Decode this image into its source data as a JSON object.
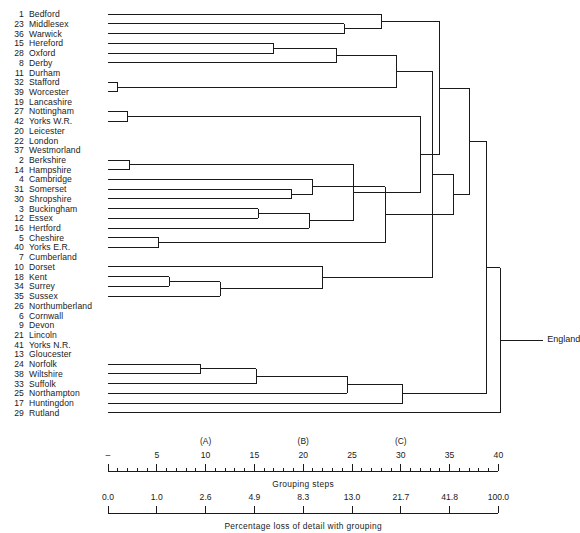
{
  "figure": {
    "type": "dendrogram",
    "root_label": "England",
    "group_markers": [
      {
        "label": "(A)",
        "step": 10
      },
      {
        "label": "(B)",
        "step": 20
      },
      {
        "label": "(C)",
        "step": 30
      }
    ],
    "axes": [
      {
        "name": "grouping-steps-axis",
        "caption": "Grouping  steps",
        "ticks": [
          "–",
          "5",
          "10",
          "15",
          "20",
          "25",
          "30",
          "35",
          "40"
        ],
        "tick_steps": [
          0,
          5,
          10,
          15,
          20,
          25,
          30,
          35,
          40
        ],
        "minor_interval": 1,
        "range": [
          0,
          41
        ]
      },
      {
        "name": "percentage-loss-axis",
        "caption": "Percentage  loss  of  detail  with  grouping",
        "ticks": [
          "0.0",
          "1.0",
          "2.6",
          "4.9",
          "8.3",
          "13.0",
          "21.7",
          "41.8",
          "100.0"
        ],
        "tick_steps": [
          0,
          5,
          10,
          15,
          20,
          25,
          30,
          35,
          40
        ],
        "range": [
          0,
          41
        ]
      }
    ],
    "leaves": [
      {
        "num": "1",
        "name": "Bedford"
      },
      {
        "num": "23",
        "name": "Middlesex"
      },
      {
        "num": "36",
        "name": "Warwick"
      },
      {
        "num": "15",
        "name": "Hereford"
      },
      {
        "num": "28",
        "name": "Oxford"
      },
      {
        "num": "8",
        "name": "Derby"
      },
      {
        "num": "11",
        "name": "Durham"
      },
      {
        "num": "32",
        "name": "Stafford"
      },
      {
        "num": "39",
        "name": "Worcester"
      },
      {
        "num": "19",
        "name": "Lancashire"
      },
      {
        "num": "27",
        "name": "Nottingham"
      },
      {
        "num": "42",
        "name": "Yorks  W.R."
      },
      {
        "num": "20",
        "name": "Leicester"
      },
      {
        "num": "22",
        "name": "London"
      },
      {
        "num": "37",
        "name": "Westmorland"
      },
      {
        "num": "2",
        "name": "Berkshire"
      },
      {
        "num": "14",
        "name": "Hampshire"
      },
      {
        "num": "4",
        "name": "Cambridge"
      },
      {
        "num": "31",
        "name": "Somerset"
      },
      {
        "num": "30",
        "name": "Shropshire"
      },
      {
        "num": "3",
        "name": "Buckingham"
      },
      {
        "num": "12",
        "name": "Essex"
      },
      {
        "num": "16",
        "name": "Hertford"
      },
      {
        "num": "5",
        "name": "Cheshire"
      },
      {
        "num": "40",
        "name": "Yorks  E.R."
      },
      {
        "num": "7",
        "name": "Cumberland"
      },
      {
        "num": "10",
        "name": "Dorset"
      },
      {
        "num": "18",
        "name": "Kent"
      },
      {
        "num": "34",
        "name": "Surrey"
      },
      {
        "num": "35",
        "name": "Sussex"
      },
      {
        "num": "26",
        "name": "Northumberland"
      },
      {
        "num": "6",
        "name": "Cornwall"
      },
      {
        "num": "9",
        "name": "Devon"
      },
      {
        "num": "21",
        "name": "Lincoln"
      },
      {
        "num": "41",
        "name": "Yorks  N.R."
      },
      {
        "num": "13",
        "name": "Gloucester"
      },
      {
        "num": "24",
        "name": "Norfolk"
      },
      {
        "num": "38",
        "name": "Wiltshire"
      },
      {
        "num": "33",
        "name": "Suffolk"
      },
      {
        "num": "25",
        "name": "Northampton"
      },
      {
        "num": "17",
        "name": "Huntingdon"
      },
      {
        "num": "29",
        "name": "Rutland"
      }
    ],
    "merges": [
      {
        "id": "m1",
        "children": [
          "leaf:7",
          "leaf:8"
        ],
        "step": 1.0
      },
      {
        "id": "m2",
        "children": [
          "leaf:10",
          "leaf:11"
        ],
        "step": 2.0
      },
      {
        "id": "m3",
        "children": [
          "leaf:15",
          "leaf:16"
        ],
        "step": 2.2
      },
      {
        "id": "m4",
        "children": [
          "leaf:23",
          "leaf:24"
        ],
        "step": 5.2
      },
      {
        "id": "m5",
        "children": [
          "leaf:27",
          "leaf:28"
        ],
        "step": 6.3
      },
      {
        "id": "m6",
        "children": [
          "leaf:36",
          "leaf:37"
        ],
        "step": 9.5
      },
      {
        "id": "m7",
        "children": [
          "m5",
          "leaf:29"
        ],
        "step": 11.5
      },
      {
        "id": "m8",
        "children": [
          "m6",
          "leaf:38"
        ],
        "step": 15.2
      },
      {
        "id": "m9",
        "children": [
          "leaf:20",
          "leaf:21"
        ],
        "step": 15.4
      },
      {
        "id": "m10",
        "children": [
          "leaf:3",
          "leaf:4"
        ],
        "step": 17.0
      },
      {
        "id": "m11",
        "children": [
          "leaf:18",
          "leaf:19"
        ],
        "step": 18.8
      },
      {
        "id": "m12",
        "children": [
          "m9",
          "leaf:22"
        ],
        "step": 20.6
      },
      {
        "id": "m13",
        "children": [
          "m11",
          "leaf:17"
        ],
        "step": 21.0
      },
      {
        "id": "m14",
        "children": [
          "m7",
          "leaf:26"
        ],
        "step": 22.0
      },
      {
        "id": "m15",
        "children": [
          "m10",
          "leaf:5"
        ],
        "step": 23.4
      },
      {
        "id": "m16",
        "children": [
          "leaf:1",
          "leaf:2"
        ],
        "step": 24.2
      },
      {
        "id": "m17",
        "children": [
          "m8",
          "leaf:39"
        ],
        "step": 24.5
      },
      {
        "id": "m18",
        "children": [
          "m3",
          "m12"
        ],
        "step": 25.2
      },
      {
        "id": "m19",
        "children": [
          "m16",
          "leaf:0"
        ],
        "step": 28.0
      },
      {
        "id": "m20",
        "children": [
          "m4",
          "m13"
        ],
        "step": 28.4
      },
      {
        "id": "m21",
        "children": [
          "m15",
          "m1"
        ],
        "step": 29.6
      },
      {
        "id": "m22",
        "children": [
          "m17",
          "leaf:40"
        ],
        "step": 30.2
      },
      {
        "id": "m23",
        "children": [
          "m2",
          "m18"
        ],
        "step": 32.0
      },
      {
        "id": "m24",
        "children": [
          "m21",
          "m14"
        ],
        "step": 33.2
      },
      {
        "id": "m25",
        "children": [
          "m19",
          "m23"
        ],
        "step": 34.0
      },
      {
        "id": "m26",
        "children": [
          "m20",
          "m24"
        ],
        "step": 35.4
      },
      {
        "id": "m27",
        "children": [
          "m25",
          "m26"
        ],
        "step": 37.0
      },
      {
        "id": "m28",
        "children": [
          "m27",
          "m22"
        ],
        "step": 38.8
      },
      {
        "id": "m29",
        "children": [
          "m28",
          "leaf:41"
        ],
        "step": 40.2
      }
    ]
  }
}
